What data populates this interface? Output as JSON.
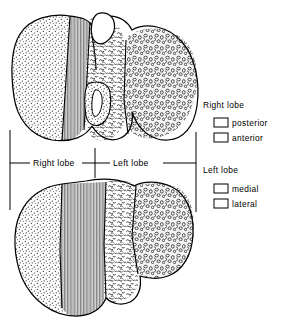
{
  "figure": {
    "views": [
      {
        "name": "superior-view",
        "description": "upper liver outline"
      },
      {
        "name": "inferior-view",
        "description": "lower liver outline"
      }
    ]
  },
  "axis": {
    "right_label": "Right lobe",
    "left_label": "Left lobe"
  },
  "legend": {
    "groups": [
      {
        "heading": "Right lobe",
        "items": [
          {
            "label": "posterior",
            "pattern": "dots",
            "swatch": "posterior-swatch"
          },
          {
            "label": "anterior",
            "pattern": "vertical-lines",
            "swatch": "anterior-swatch"
          }
        ]
      },
      {
        "heading": "Left lobe",
        "items": [
          {
            "label": "medial",
            "pattern": "squiggles",
            "swatch": "medial-swatch"
          },
          {
            "label": "lateral",
            "pattern": "circles",
            "swatch": "lateral-swatch"
          }
        ]
      }
    ]
  },
  "colors": {
    "ink": "#000000",
    "paper": "#ffffff",
    "fill_tint": "#f6f6f6"
  }
}
